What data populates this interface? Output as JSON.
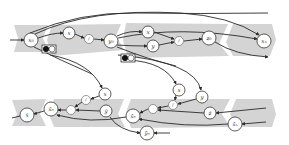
{
  "colors": {
    "band": "#d4d4d4",
    "node_fill": "#ffffff",
    "node_stroke": "#333333",
    "edge": "#2a2a2a",
    "background": "#ffffff"
  },
  "forward": {
    "nodes": [
      {
        "id": "x0",
        "label": "x₀",
        "cx": 31,
        "cy": 40,
        "r": 7
      },
      {
        "id": "x_a",
        "label": "x",
        "cx": 69,
        "cy": 33,
        "r": 6
      },
      {
        "id": "f_a",
        "label": "f",
        "cx": 89,
        "cy": 39,
        "r": 4.5
      },
      {
        "id": "y0",
        "label": "y₀",
        "cx": 111,
        "cy": 41,
        "r": 7
      },
      {
        "id": "x_b",
        "label": "x",
        "cx": 148,
        "cy": 32,
        "r": 6
      },
      {
        "id": "y_b",
        "label": "y",
        "cx": 153,
        "cy": 46,
        "r": 6
      },
      {
        "id": "f_b",
        "label": "f",
        "cx": 179,
        "cy": 41,
        "r": 4.5
      },
      {
        "id": "z0",
        "label": "z₀",
        "cx": 209,
        "cy": 38,
        "r": 7
      },
      {
        "id": "xn",
        "label": "xₙ",
        "cx": 264,
        "cy": 41,
        "r": 7
      }
    ],
    "checkpoints": [
      {
        "id": "cp1",
        "x": 42,
        "y": 45
      },
      {
        "id": "cp2",
        "x": 121,
        "y": 54
      }
    ]
  },
  "backward": {
    "nodes": [
      {
        "id": "xbar",
        "label": "x̄",
        "cx": 27,
        "cy": 115,
        "r": 7
      },
      {
        "id": "xbar0",
        "label": "x̄₀",
        "cx": 51,
        "cy": 109,
        "r": 7
      },
      {
        "id": "gbar_a",
        "label": "·",
        "cx": 71,
        "cy": 110,
        "r": 4.5
      },
      {
        "id": "fbar_a",
        "label": "f",
        "cx": 86,
        "cy": 100,
        "r": 4.5
      },
      {
        "id": "x_c",
        "label": "x",
        "cx": 105,
        "cy": 94,
        "r": 6
      },
      {
        "id": "ybar",
        "label": "ȳ",
        "cx": 106,
        "cy": 111,
        "r": 6
      },
      {
        "id": "xbar0b",
        "label": "x̄₀",
        "cx": 133,
        "cy": 116,
        "r": 7
      },
      {
        "id": "ybar0",
        "label": "ȳ₀",
        "cx": 147,
        "cy": 133,
        "r": 7
      },
      {
        "id": "gbar_b",
        "label": "·",
        "cx": 153,
        "cy": 109,
        "r": 4.5
      },
      {
        "id": "fbar_b",
        "label": "f",
        "cx": 173,
        "cy": 105,
        "r": 4.5
      },
      {
        "id": "x_d",
        "label": "x",
        "cx": 179,
        "cy": 90,
        "r": 6
      },
      {
        "id": "y_d",
        "label": "y",
        "cx": 202,
        "cy": 97,
        "r": 6
      },
      {
        "id": "zbar",
        "label": "z̄",
        "cx": 210,
        "cy": 113,
        "r": 6
      },
      {
        "id": "xnbar",
        "label": "x̄ₙ",
        "cx": 235,
        "cy": 124,
        "r": 7
      }
    ]
  }
}
